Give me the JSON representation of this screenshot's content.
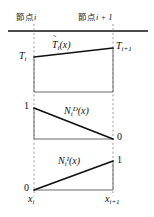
{
  "figure": {
    "type": "technical-diagram",
    "node_labels": {
      "left_prefix": "節点",
      "left_index": "i",
      "right_prefix": "節点",
      "right_index": "i + 1"
    },
    "panels": [
      {
        "id": "panel-temperature",
        "curve_label_base": "T",
        "curve_label_accent": "˜",
        "curve_label_sub": "i",
        "curve_label_arg": "(x)",
        "left_value_base": "T",
        "left_value_sub": "i",
        "right_value_base": "T",
        "right_value_sub": "i+1",
        "shape": "trapezoid",
        "left_height": 0.62,
        "right_height": 0.86
      },
      {
        "id": "panel-shape-D",
        "curve_label_base": "N",
        "curve_label_sub": "i",
        "curve_label_sup": "D",
        "curve_label_arg": "(x)",
        "left_value": "1",
        "right_value": "0",
        "shape": "descending-triangle",
        "left_height": 1.0,
        "right_height": 0.0
      },
      {
        "id": "panel-shape-I",
        "curve_label_base": "N",
        "curve_label_sub": "i",
        "curve_label_sup": "I",
        "curve_label_arg": "(x)",
        "left_value": "0",
        "right_value": "1",
        "shape": "ascending-triangle",
        "left_height": 0.0,
        "right_height": 1.0
      }
    ],
    "axis_labels": {
      "left_base": "x",
      "left_sub": "i",
      "right_base": "x",
      "right_sub": "i+1"
    },
    "colors": {
      "line": "#111111",
      "thin_line": "#6b6b6b",
      "dashed_guide": "#9a9a9a",
      "background": "#ffffff",
      "text": "#1a1a1a"
    },
    "geometry": {
      "left_guide_x": 34,
      "right_guide_x": 113,
      "top_rule_y": 31,
      "panel1_baseline_y": 92,
      "panel2_baseline_y": 139,
      "panel3_baseline_y": 190
    }
  }
}
